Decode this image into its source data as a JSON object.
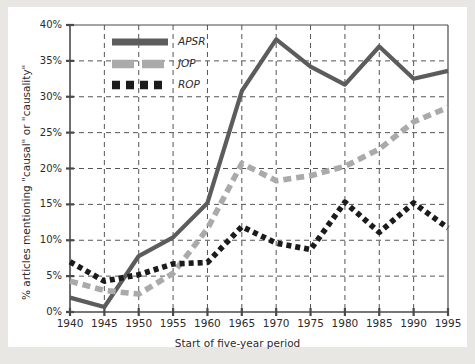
{
  "chart_data": {
    "type": "line",
    "title": "",
    "xlabel": "Start of five-year period",
    "ylabel": "% articles mentioning \"causal\" or \"causality\"",
    "x": [
      1940,
      1945,
      1950,
      1955,
      1960,
      1965,
      1970,
      1975,
      1980,
      1985,
      1990,
      1995
    ],
    "xtick_labels": [
      "1940",
      "1945",
      "1950",
      "1955",
      "1960",
      "1965",
      "1970",
      "1975",
      "1980",
      "1985",
      "1990",
      "1995"
    ],
    "ytick_labels": [
      "0%",
      "5%",
      "10%",
      "15%",
      "20%",
      "25%",
      "30%",
      "35%",
      "40%"
    ],
    "ytick_values": [
      0,
      5,
      10,
      15,
      20,
      25,
      30,
      35,
      40
    ],
    "xlim": [
      1940,
      1995
    ],
    "ylim": [
      0,
      40
    ],
    "grid": true,
    "grid_style": "dashed",
    "legend_position": "top-left-inside",
    "series": [
      {
        "name": "APSR",
        "style": "solid",
        "color": "#5c5c5c",
        "values": [
          2.0,
          0.7,
          7.8,
          10.4,
          15.2,
          30.8,
          38.0,
          34.2,
          31.7,
          37.0,
          32.5,
          33.6
        ]
      },
      {
        "name": "JOP",
        "style": "dashed",
        "color": "#aaaaaa",
        "values": [
          4.3,
          3.0,
          2.5,
          5.4,
          11.6,
          20.7,
          18.3,
          19.0,
          20.3,
          22.7,
          26.5,
          28.5
        ]
      },
      {
        "name": "ROP",
        "style": "dotted",
        "color": "#1b1b1b",
        "values": [
          7.0,
          4.3,
          5.2,
          6.7,
          6.9,
          11.9,
          9.6,
          8.7,
          15.3,
          11.1,
          15.2,
          11.7
        ]
      }
    ]
  },
  "axes": {
    "y_label": "% articles mentioning \"causal\" or \"causality\"",
    "x_label": "Start of five-year period"
  },
  "legend": {
    "items": [
      {
        "label": "APSR",
        "swatch": "solid-thick-dark-gray"
      },
      {
        "label": "JOP",
        "swatch": "dashed-light-gray"
      },
      {
        "label": "ROP",
        "swatch": "dotted-black"
      }
    ]
  },
  "colors": {
    "apsr": "#5c5c5c",
    "jop": "#aaaaaa",
    "rop": "#1b1b1b",
    "axis": "#4a4a4a",
    "grid": "#555555",
    "plot_bg": "#ffffff",
    "page_bg": "#e9e7e3"
  }
}
